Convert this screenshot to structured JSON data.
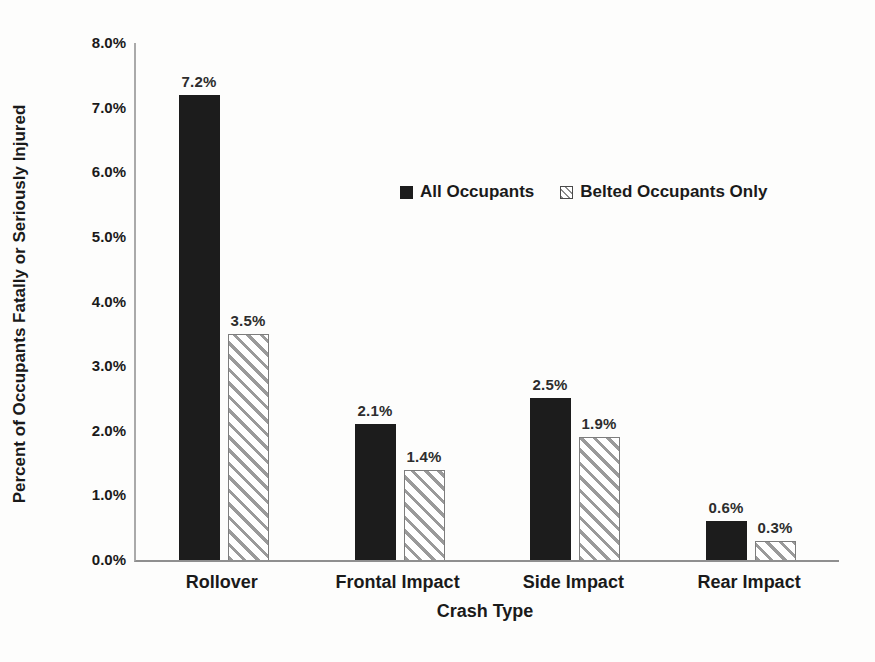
{
  "chart_data": {
    "type": "bar",
    "title": "",
    "categories": [
      "Rollover",
      "Frontal Impact",
      "Side Impact",
      "Rear Impact"
    ],
    "series": [
      {
        "name": "All Occupants",
        "style": "solid-black",
        "values": [
          7.2,
          2.1,
          2.5,
          0.6
        ],
        "data_labels": [
          "7.2%",
          "2.1%",
          "2.5%",
          "0.6%"
        ]
      },
      {
        "name": "Belted Occupants Only",
        "style": "diagonal-hatch",
        "values": [
          3.5,
          1.4,
          1.9,
          0.3
        ],
        "data_labels": [
          "3.5%",
          "1.4%",
          "1.9%",
          "0.3%"
        ]
      }
    ],
    "xlabel": "Crash Type",
    "ylabel": "Percent of Occupants Fatally or Seriously Injured",
    "ylim": [
      0,
      8
    ],
    "ytick_step": 1,
    "ytick_labels": [
      "0.0%",
      "1.0%",
      "2.0%",
      "3.0%",
      "4.0%",
      "5.0%",
      "6.0%",
      "7.0%",
      "8.0%"
    ],
    "grid": false,
    "legend_position": "inside-upper-right",
    "colors": {
      "solid_bar": "#1c1c1c",
      "hatch_line": "#9a9a9a",
      "hatch_border": "#7d7d7d",
      "axis_line": "#9a9a9a",
      "text": "#1a1a1a",
      "background": "#fdfdfc"
    }
  }
}
